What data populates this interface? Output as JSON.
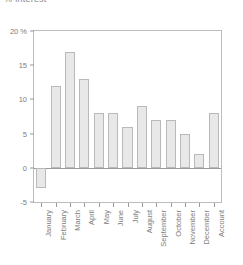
{
  "chart_data": {
    "type": "bar",
    "title": "% Interest",
    "xlabel": "",
    "ylabel": "",
    "ylim": [
      -5,
      20
    ],
    "yticks": [
      20,
      15,
      10,
      5,
      0,
      -5
    ],
    "ytick_labels": [
      "20 %",
      "15",
      "10",
      "5",
      "0",
      "-5"
    ],
    "grid": false,
    "legend": null,
    "zero_line": true,
    "categories": [
      "January",
      "February",
      "March",
      "April",
      "May",
      "June",
      "July",
      "August",
      "September",
      "October",
      "November",
      "December",
      "Account"
    ],
    "values": [
      -3,
      12,
      17,
      13,
      8,
      8,
      6,
      9,
      7,
      7,
      5,
      2,
      8
    ],
    "bar_fill": "#e8e8e8",
    "bar_border": "#b9b9b9",
    "axis_color": "#9a9a9a",
    "text_color": "#7d7d7d"
  }
}
